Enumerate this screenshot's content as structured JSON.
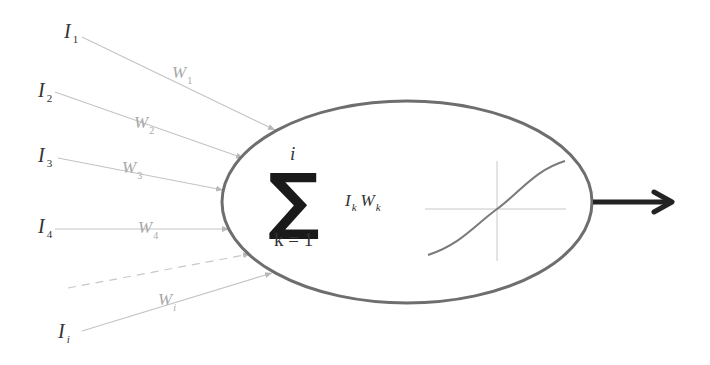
{
  "diagram": {
    "colors": {
      "input_line": "#c4c4c4",
      "weight_text": "#a8a8a8",
      "neuron_outline": "#6e6e6e",
      "text": "#333333",
      "sigma": "#1a1a1a",
      "activation_curve": "#7a7a7a",
      "activation_axes": "#c8c8c8",
      "output_arrow": "#222222"
    },
    "inputs": [
      {
        "label": "I",
        "sub": "1",
        "weight": "W",
        "weight_sub": "1"
      },
      {
        "label": "I",
        "sub": "2",
        "weight": "W",
        "weight_sub": "2"
      },
      {
        "label": "I",
        "sub": "3",
        "weight": "W",
        "weight_sub": "3"
      },
      {
        "label": "I",
        "sub": "4",
        "weight": "W",
        "weight_sub": "4"
      },
      {
        "label": "I",
        "sub": "i",
        "weight": "W",
        "weight_sub": "i"
      }
    ],
    "summation": {
      "symbol": "∑",
      "upper_limit": "i",
      "lower_limit": "k = 1",
      "term_input": "I",
      "term_input_sub": "k",
      "term_weight": "W",
      "term_weight_sub": "k"
    },
    "activation": "sigmoid",
    "output": "output-arrow"
  }
}
